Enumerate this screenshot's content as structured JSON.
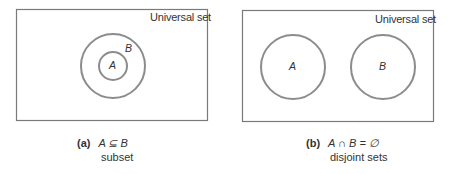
{
  "colors": {
    "box_border": "#7a7a7a",
    "circle_stroke": "#8c8c8c",
    "text": "#333333"
  },
  "panels": [
    {
      "id": "a",
      "universal_label": "Universal set",
      "sets": [
        {
          "label": "B",
          "shape": "circle",
          "cx": 113,
          "cy": 66,
          "r": 32
        },
        {
          "label": "A",
          "shape": "circle",
          "cx": 113,
          "cy": 66,
          "r": 14
        }
      ],
      "caption": {
        "tag": "(a)",
        "expression": "A ⊆ B",
        "description": "subset"
      }
    },
    {
      "id": "b",
      "universal_label": "Universal set",
      "sets": [
        {
          "label": "A",
          "shape": "circle",
          "cx": 293,
          "cy": 67,
          "r": 32
        },
        {
          "label": "B",
          "shape": "circle",
          "cx": 383,
          "cy": 67,
          "r": 32
        }
      ],
      "caption": {
        "tag": "(b)",
        "expression": "A ∩ B = ∅",
        "description": "disjoint sets"
      }
    }
  ]
}
